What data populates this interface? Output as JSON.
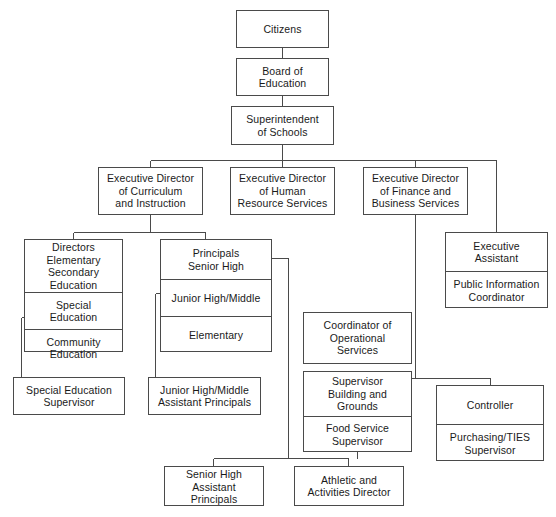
{
  "chart": {
    "type": "org-chart",
    "line_color": "#4a4a4a",
    "background_color": "#ffffff",
    "text_color": "#1a1a1a"
  },
  "nodes": {
    "citizens": {
      "label": "Citizens"
    },
    "board_of_education": {
      "label": "Board of\nEducation"
    },
    "superintendent": {
      "label": "Superintendent\nof Schools"
    },
    "exec_dir_curriculum": {
      "label": "Executive Director\nof Curriculum\nand Instruction"
    },
    "exec_dir_human_resource": {
      "label": "Executive Director\nof Human\nResource Services"
    },
    "exec_dir_finance": {
      "label": "Executive Director\nof Finance and\nBusiness Services"
    },
    "directors_elementary": {
      "label": "Directors Elementary\nSecondary Education"
    },
    "special_education": {
      "label": "Special\nEducation"
    },
    "community_education": {
      "label": "Community\nEducation"
    },
    "principals_senior_high": {
      "label": "Principals\nSenior High"
    },
    "junior_high_middle": {
      "label": "Junior High/Middle"
    },
    "elementary": {
      "label": "Elementary"
    },
    "executive_assistant": {
      "label": "Executive\nAssistant"
    },
    "public_information_coordinator": {
      "label": "Public Information\nCoordinator"
    },
    "special_education_supervisor": {
      "label": "Special Education\nSupervisor"
    },
    "junior_high_middle_assistant_principals": {
      "label": "Junior High/Middle\nAssistant Principals"
    },
    "coordinator_operational": {
      "label": "Coordinator of\nOperational\nServices"
    },
    "supervisor_building_grounds": {
      "label": "Supervisor\nBuilding and\nGrounds"
    },
    "food_service_supervisor": {
      "label": "Food Service\nSupervisor"
    },
    "controller": {
      "label": "Controller"
    },
    "purchasing_ties_supervisor": {
      "label": "Purchasing/TIES\nSupervisor"
    },
    "senior_high_assistant_principals": {
      "label": "Senior High\nAssistant Principals"
    },
    "athletic_activities_director": {
      "label": "Athletic and\nActivities Director"
    }
  }
}
